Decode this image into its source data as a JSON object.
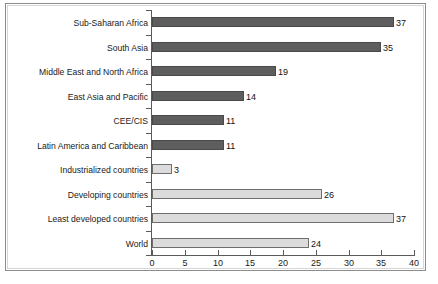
{
  "chart_data": {
    "type": "bar",
    "orientation": "horizontal",
    "title": "",
    "subtitle": "",
    "xlabel": "",
    "ylabel": "",
    "xlim": [
      0,
      40
    ],
    "xticks": [
      0,
      5,
      10,
      15,
      20,
      25,
      30,
      35,
      40
    ],
    "xtick_labels": [
      "0",
      "5",
      "10",
      "15",
      "20",
      "25",
      "30",
      "35",
      "40"
    ],
    "grid": false,
    "legend": false,
    "categories": [
      "Sub-Saharan Africa",
      "South Asia",
      "Middle East and North Africa",
      "East Asia and Pacific",
      "CEE/CIS",
      "Latin America and Caribbean",
      "Industrialized countries",
      "Developing countries",
      "Least developed countries",
      "World"
    ],
    "values": [
      37,
      35,
      19,
      14,
      11,
      11,
      3,
      26,
      37,
      24
    ],
    "value_labels": [
      "37",
      "35",
      "19",
      "14",
      "11",
      "11",
      "3",
      "26",
      "37",
      "24"
    ],
    "bar_styles": [
      "dark",
      "dark",
      "dark",
      "dark",
      "dark",
      "dark",
      "light",
      "light",
      "light",
      "light"
    ],
    "colors": {
      "dark_bar_fill": "#5e5e5e",
      "dark_bar_border": "#4a4a4a",
      "light_bar_fill": "#dcdcdc",
      "light_bar_border": "#6e6e6e",
      "axis": "#5a5a5a",
      "frame_outer": "#8c8c8c",
      "frame_inner": "#d6d6d6",
      "text": "#1a1a1a",
      "background": "#ffffff"
    }
  }
}
